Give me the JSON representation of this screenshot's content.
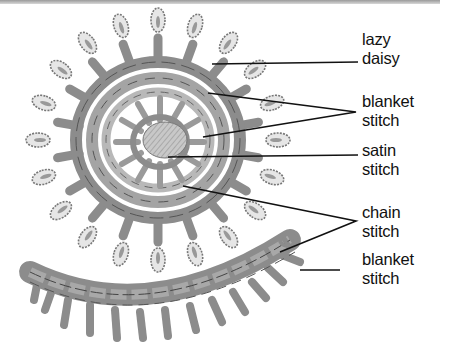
{
  "diagram": {
    "labels": [
      {
        "id": "lazy-daisy",
        "line1": "lazy",
        "line2": "daisy",
        "x": 362,
        "y": 30
      },
      {
        "id": "blanket-stitch-top",
        "line1": "blanket",
        "line2": "stitch",
        "x": 362,
        "y": 92
      },
      {
        "id": "satin-stitch",
        "line1": "satin",
        "line2": "stitch",
        "x": 362,
        "y": 141
      },
      {
        "id": "chain-stitch",
        "line1": "chain",
        "line2": "stitch",
        "x": 362,
        "y": 203
      },
      {
        "id": "blanket-stitch-bottom",
        "line1": "blanket",
        "line2": "stitch",
        "x": 362,
        "y": 250
      }
    ]
  },
  "colors": {
    "thread": "#8c8c8c",
    "thread_dark": "#5a5a5a",
    "thread_light": "#b5b5b5",
    "leader": "#111111",
    "background": "#ffffff"
  }
}
